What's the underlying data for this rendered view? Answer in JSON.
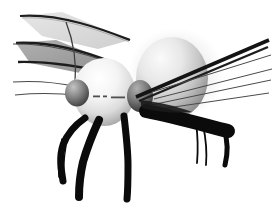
{
  "image": {
    "title": "3D rendered grayscale insect",
    "subject": "fly-like insect with two body spheres, wings, antennae and six legs",
    "width": 273,
    "height": 210,
    "background_color": "#ffffff",
    "style": "greyscale computer generated raytraced render, soft shading, hard black silhouette limbs",
    "caption": ""
  },
  "palette": {
    "background": "#ffffff",
    "body_highlight": "#fdfdfd",
    "body_light": "#ededed",
    "body_mid": "#c9c9c9",
    "body_shadow": "#9a9a9a",
    "body_deep_shadow": "#6e6e6e",
    "eye_light": "#b4b4b4",
    "eye_mid": "#7d7d7d",
    "eye_dark": "#3a3a3a",
    "wing_fill": "#a6a6a6",
    "wing_fill_light": "#d6d6d6",
    "wing_edge": "#2b2b2b",
    "limb_black": "#0b0b0b",
    "hair_line": "#4a4a4a"
  },
  "parts": {
    "head": {
      "name": "head-sphere",
      "center_x": 104,
      "center_y": 92,
      "radius_x": 31,
      "radius_y": 34,
      "tone": "bright white sphere with shadow on lower left"
    },
    "thorax": {
      "name": "thorax-abdomen-ellipsoid",
      "center_x": 172,
      "center_y": 78,
      "radius_x": 36,
      "radius_y": 40,
      "tone": "light grey ellipsoid, highlight upper left, shadow lower right"
    },
    "eye_left": {
      "name": "left-eye-sphere",
      "center_x": 77,
      "center_y": 93,
      "radius_x": 12,
      "radius_y": 13,
      "tone": "dark grey sphere"
    },
    "eye_right": {
      "name": "right-eye-sphere",
      "center_x": 140,
      "center_y": 95,
      "radius_x": 13,
      "radius_y": 16,
      "tone": "dark grey sphere at body junction"
    },
    "mouth_marks": {
      "name": "mouth-dash-marks",
      "dashes": [
        {
          "x": 93,
          "y": 96,
          "w": 7,
          "h": 2
        },
        {
          "x": 103,
          "y": 96,
          "w": 4,
          "h": 2
        },
        {
          "x": 111,
          "y": 97,
          "w": 14,
          "h": 2
        }
      ]
    },
    "wings": [
      {
        "name": "upper-wing",
        "points": "20,16 60,13 128,40 96,48 42,36",
        "fill": "#dcdcdc",
        "edge": "#2b2b2b"
      },
      {
        "name": "lower-wing",
        "points": "16,42 54,40 112,62 78,72 30,62",
        "fill": "#a6a6a6",
        "edge": "#2b2b2b"
      }
    ],
    "antennae": [
      {
        "name": "antenna-curved-left",
        "path": "M66,22 C72,38 76,58 74,82"
      },
      {
        "name": "antenna-upper-left",
        "path": "M18,15 C60,17 104,32 128,43"
      },
      {
        "name": "antenna-mid-left",
        "path": "M12,44 C52,43 94,56 114,64"
      },
      {
        "name": "antenna-lower-left",
        "path": "M14,82 C44,81 64,84 76,87"
      },
      {
        "name": "antenna-lowest-left",
        "path": "M16,95 C46,93 66,94 78,96"
      }
    ],
    "right_bristles": [
      {
        "name": "bristle-right-thick",
        "path": "M136,96 L268,41",
        "width": 3.4
      },
      {
        "name": "bristle-right-thick-2",
        "path": "M138,99 L266,47",
        "width": 2.6
      },
      {
        "name": "bristle-right-1",
        "path": "M150,90 L270,54"
      },
      {
        "name": "bristle-right-2",
        "path": "M152,98 L271,68"
      },
      {
        "name": "bristle-right-3",
        "path": "M150,104 L270,79"
      },
      {
        "name": "bristle-right-4",
        "path": "M146,110 L268,92"
      }
    ],
    "legs": [
      {
        "name": "leg-front-left",
        "path": "M84,120 C74,126 66,134 62,144 C58,156 60,168 62,180",
        "width": 7
      },
      {
        "name": "leg-front-left-hair",
        "path": "M63,140 C60,154 59,166 60,176",
        "width": 1.4
      },
      {
        "name": "leg-front-left-hair2",
        "path": "M66,146 C64,158 63,170 64,180",
        "width": 1.2
      },
      {
        "name": "leg-mid-left",
        "path": "M98,122 C92,134 86,148 82,162 C79,174 78,186 78,196",
        "width": 8
      },
      {
        "name": "leg-center",
        "path": "M124,118 C126,134 128,150 128,164 C128,176 128,188 127,198",
        "width": 7
      },
      {
        "name": "leg-rear-right-thick",
        "path": "M148,112 C176,118 204,126 226,132",
        "width": 13
      },
      {
        "name": "leg-rear-right-down",
        "path": "M222,128 C226,140 226,152 224,164",
        "width": 5
      },
      {
        "name": "leg-hair-right-1",
        "path": "M196,122 C198,136 198,150 197,162",
        "width": 1.6
      },
      {
        "name": "leg-hair-right-2",
        "path": "M202,124 C205,138 206,152 205,164",
        "width": 1.6
      },
      {
        "name": "leg-shadow-right",
        "path": "M172,108 C186,112 200,118 212,124",
        "width": 9
      }
    ]
  }
}
